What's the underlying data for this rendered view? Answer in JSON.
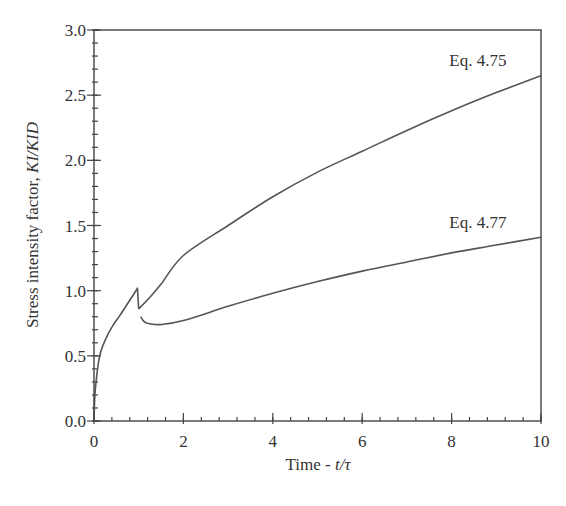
{
  "chart_data": {
    "type": "line",
    "title": "",
    "xlabel": "Time - t/τ",
    "xlabel_parts": {
      "prefix": "Time - ",
      "italic": "t/τ"
    },
    "ylabel": "Stress intensity factor, KI/KID",
    "ylabel_parts": {
      "prefix": "Stress intensity factor, ",
      "italic": "KI/KID"
    },
    "xlim": [
      0,
      10
    ],
    "ylim": [
      0,
      3.0
    ],
    "x_ticks": [
      0,
      2,
      4,
      6,
      8,
      10
    ],
    "x_tick_labels": [
      "0",
      "2",
      "4",
      "6",
      "8",
      "10"
    ],
    "x_minor_step": 0.4,
    "y_ticks": [
      0.0,
      0.5,
      1.0,
      1.5,
      2.0,
      2.5,
      3.0
    ],
    "y_tick_labels": [
      "0.0",
      "0.5",
      "1.0",
      "1.5",
      "2.0",
      "2.5",
      "3.0"
    ],
    "y_minor_step": 0.1,
    "grid": false,
    "legend": "none (inline annotations)",
    "shared_initial_segment": {
      "name": "Initial loading (both)",
      "x": [
        0,
        0.02,
        0.05,
        0.1,
        0.15,
        0.25,
        0.4,
        0.58,
        0.75,
        0.92,
        0.97,
        1.0
      ],
      "y": [
        0,
        0.2,
        0.31,
        0.45,
        0.53,
        0.62,
        0.72,
        0.81,
        0.9,
        0.99,
        1.02,
        0.86
      ]
    },
    "series": [
      {
        "name": "Eq. 4.75",
        "x": [
          1.0,
          1.25,
          1.5,
          2,
          3,
          4,
          5,
          6,
          7,
          8,
          9,
          10
        ],
        "y": [
          0.86,
          0.95,
          1.05,
          1.27,
          1.5,
          1.72,
          1.91,
          2.07,
          2.23,
          2.38,
          2.52,
          2.65
        ]
      },
      {
        "name": "Eq. 4.77",
        "x": [
          1.05,
          1.1,
          1.2,
          1.5,
          2,
          3,
          4,
          5,
          6,
          7,
          8,
          9,
          10
        ],
        "y": [
          0.8,
          0.77,
          0.75,
          0.74,
          0.77,
          0.88,
          0.98,
          1.07,
          1.15,
          1.22,
          1.29,
          1.35,
          1.41
        ]
      }
    ],
    "annotations": [
      {
        "text": "Eq. 4.75",
        "x": 7.95,
        "y": 2.72
      },
      {
        "text": "Eq. 4.77",
        "x": 7.95,
        "y": 1.48
      }
    ]
  },
  "colors": {
    "line": "#555555",
    "axis": "#444444",
    "text": "#333333",
    "background": "#ffffff"
  }
}
